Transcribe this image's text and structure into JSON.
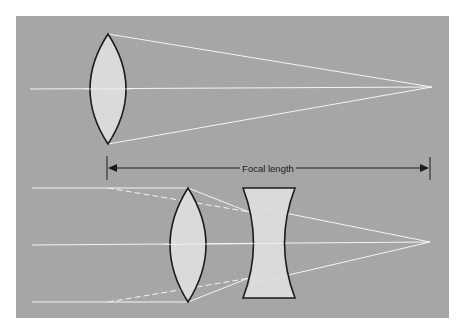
{
  "diagram": {
    "focal_length_label": "Focal length",
    "colors": {
      "background": "#ffffff",
      "panel": "#a6a6a6",
      "lens_fill": "#dedede",
      "lens_stroke": "#1c1c1c",
      "ray": "#f4f4f4",
      "arrow": "#1c1c1c"
    },
    "top": {
      "element": "single convex lens",
      "rays": 3,
      "converge_point": "right focal point"
    },
    "bottom": {
      "elements": [
        "convex lens",
        "concave lens"
      ],
      "rays": 3,
      "converge_point": "right focal point"
    }
  }
}
